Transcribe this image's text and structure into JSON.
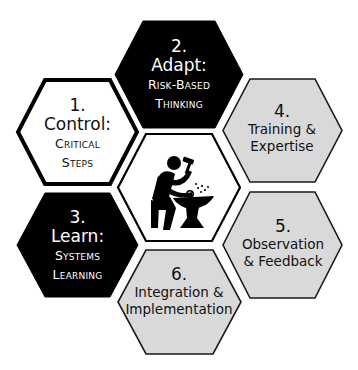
{
  "colors": {
    "black": "#000000",
    "white": "#ffffff",
    "gray_fill": "#d9d9d9",
    "outline": "#1a1a1a"
  },
  "center": {
    "icon": "blacksmith-anvil-icon",
    "description": "Person hammering on an anvil with sparks"
  },
  "hexagons": [
    {
      "id": 1,
      "number": "1.",
      "title": "Control:",
      "subtitle_line1": "Critical",
      "subtitle_line2": "Steps",
      "style": "white-thick-border"
    },
    {
      "id": 2,
      "number": "2.",
      "title": "Adapt:",
      "subtitle_line1": "Risk-Based",
      "subtitle_line2": "Thinking",
      "style": "black"
    },
    {
      "id": 3,
      "number": "3.",
      "title": "Learn:",
      "subtitle_line1": "Systems",
      "subtitle_line2": "Learning",
      "style": "black"
    },
    {
      "id": 4,
      "number": "4.",
      "line1": "Training &",
      "line2": "Expertise",
      "style": "gray"
    },
    {
      "id": 5,
      "number": "5.",
      "line1": "Observation",
      "line2": "& Feedback",
      "style": "gray"
    },
    {
      "id": 6,
      "number": "6.",
      "line1": "Integration &",
      "line2": "Implementation",
      "style": "gray"
    }
  ]
}
